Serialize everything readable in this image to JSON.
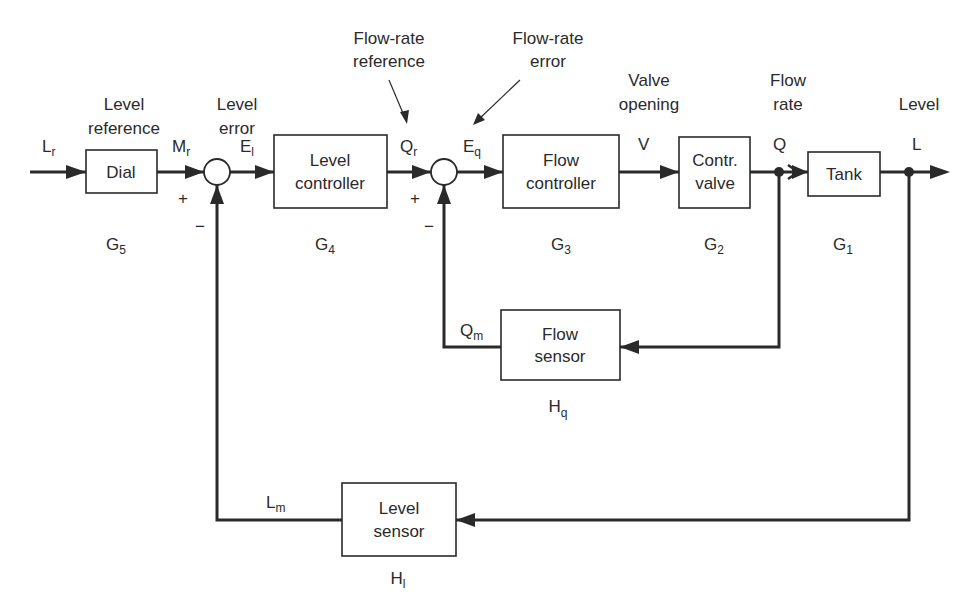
{
  "annotations": {
    "level_reference": [
      "Level",
      "reference"
    ],
    "level_error": [
      "Level",
      "error"
    ],
    "flow_rate_reference": [
      "Flow-rate",
      "reference"
    ],
    "flow_rate_error": [
      "Flow-rate",
      "error"
    ],
    "valve_opening": [
      "Valve",
      "opening"
    ],
    "flow_rate": [
      "Flow",
      "rate"
    ],
    "level": [
      "Level"
    ]
  },
  "signals": {
    "Lr": {
      "main": "L",
      "sub": "r"
    },
    "Mr": {
      "main": "M",
      "sub": "r"
    },
    "El": {
      "main": "E",
      "sub": "l"
    },
    "Qr": {
      "main": "Q",
      "sub": "r"
    },
    "Eq": {
      "main": "E",
      "sub": "q"
    },
    "V": {
      "main": "V"
    },
    "Q": {
      "main": "Q"
    },
    "L": {
      "main": "L"
    },
    "Qm": {
      "main": "Q",
      "sub": "m"
    },
    "Lm": {
      "main": "L",
      "sub": "m"
    }
  },
  "blocks": {
    "dial": {
      "lines": [
        "Dial"
      ],
      "tf_main": "G",
      "tf_sub": "5"
    },
    "level_controller": {
      "lines": [
        "Level",
        "controller"
      ],
      "tf_main": "G",
      "tf_sub": "4"
    },
    "flow_controller": {
      "lines": [
        "Flow",
        "controller"
      ],
      "tf_main": "G",
      "tf_sub": "3"
    },
    "control_valve": {
      "lines": [
        "Contr.",
        "valve"
      ],
      "tf_main": "G",
      "tf_sub": "2"
    },
    "tank": {
      "lines": [
        "Tank"
      ],
      "tf_main": "G",
      "tf_sub": "1"
    },
    "flow_sensor": {
      "lines": [
        "Flow",
        "sensor"
      ],
      "tf_main": "H",
      "tf_sub": "q"
    },
    "level_sensor": {
      "lines": [
        "Level",
        "sensor"
      ],
      "tf_main": "H",
      "tf_sub": "l"
    }
  },
  "summing_junctions": {
    "level_summer": {
      "plus": "+",
      "minus": "−"
    },
    "flow_summer": {
      "plus": "+",
      "minus": "−"
    }
  }
}
